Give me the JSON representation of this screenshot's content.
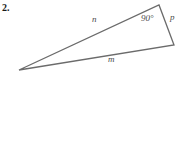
{
  "figure": {
    "problem_number": "2.",
    "background_color": "#ffffff",
    "stroke_color": "#6b6b6b",
    "label_color": "#4a4a4a",
    "stroke_width": 1.3,
    "shape": "triangle",
    "vertices": [
      {
        "name": "left-apex",
        "x": 19,
        "y": 70
      },
      {
        "name": "top-right",
        "x": 159,
        "y": 5
      },
      {
        "name": "bottom-right",
        "x": 174,
        "y": 45
      }
    ],
    "polygon_points": "19,70 159,5 174,45",
    "labels": {
      "side_n": "n",
      "side_m": "m",
      "side_p": "p",
      "angle_right": "90°"
    },
    "sides": [
      {
        "label": "n",
        "from": "left-apex",
        "to": "top-right"
      },
      {
        "label": "p",
        "from": "top-right",
        "to": "bottom-right"
      },
      {
        "label": "m",
        "from": "bottom-right",
        "to": "left-apex"
      }
    ],
    "angles": [
      {
        "at": "top-right",
        "label": "90°",
        "type": "right-angle"
      }
    ]
  }
}
